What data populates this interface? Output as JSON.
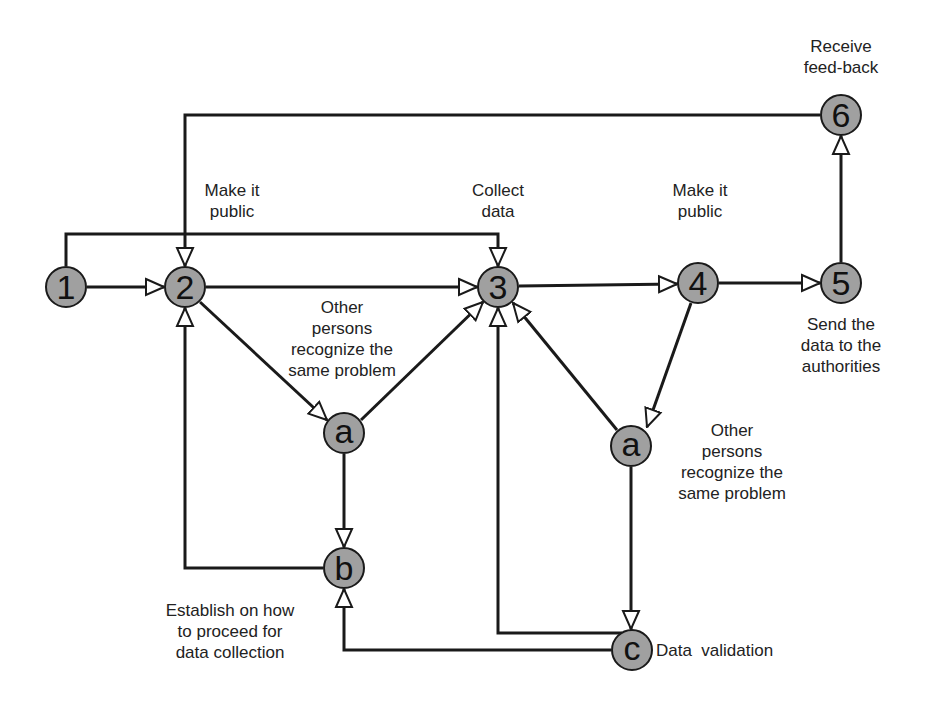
{
  "colors": {
    "node_fill": "#a0a0a0",
    "stroke": "#1a1a1a",
    "background": "#ffffff"
  },
  "nodes": {
    "n1": {
      "label": "1",
      "x": 66,
      "y": 287
    },
    "n2": {
      "label": "2",
      "x": 185,
      "y": 287
    },
    "n3": {
      "label": "3",
      "x": 498,
      "y": 287
    },
    "n4": {
      "label": "4",
      "x": 698,
      "y": 283
    },
    "n5": {
      "label": "5",
      "x": 841,
      "y": 283
    },
    "n6": {
      "label": "6",
      "x": 841,
      "y": 115
    },
    "a_left": {
      "label": "a",
      "x": 344,
      "y": 433
    },
    "b": {
      "label": "b",
      "x": 344,
      "y": 568
    },
    "a_right": {
      "label": "a",
      "x": 631,
      "y": 446
    },
    "c": {
      "label": "c",
      "x": 632,
      "y": 650
    }
  },
  "annotations": {
    "receive_feedback": "Receive\nfeed-back",
    "make_public_left": "Make it\npublic",
    "collect_data": "Collect\ndata",
    "make_public_right": "Make it\npublic",
    "other_persons_left": "Other\npersons\nrecognize the\nsame problem",
    "send_data": "Send the\ndata to the\nauthorities",
    "other_persons_right": "Other\npersons\nrecognize the\nsame problem",
    "establish": "Establish on how\nto proceed for\ndata collection",
    "data_validation": "Data  validation"
  },
  "edges": [
    {
      "from": "1",
      "to": "2"
    },
    {
      "from": "1",
      "to": "3",
      "via": "top line y=234"
    },
    {
      "from": "2",
      "to": "3"
    },
    {
      "from": "2",
      "to": "a_left"
    },
    {
      "from": "a_left",
      "to": "3"
    },
    {
      "from": "a_left",
      "to": "b"
    },
    {
      "from": "b",
      "to": "2"
    },
    {
      "from": "3",
      "to": "4"
    },
    {
      "from": "4",
      "to": "5"
    },
    {
      "from": "4",
      "to": "a_right"
    },
    {
      "from": "a_right",
      "to": "3"
    },
    {
      "from": "a_right",
      "to": "c"
    },
    {
      "from": "c",
      "to": "3"
    },
    {
      "from": "c",
      "to": "b"
    },
    {
      "from": "5",
      "to": "6"
    },
    {
      "from": "6",
      "to": "2"
    }
  ]
}
